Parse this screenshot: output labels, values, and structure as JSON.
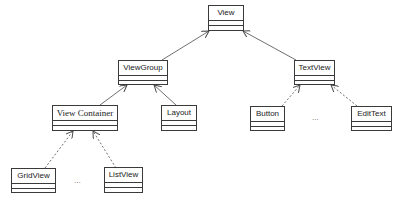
{
  "diagram": {
    "type": "uml-class-hierarchy",
    "classes": [
      {
        "id": "view",
        "name": "View"
      },
      {
        "id": "viewgroup",
        "name": "ViewGroup"
      },
      {
        "id": "textview",
        "name": "TextView"
      },
      {
        "id": "viewcontainer",
        "name": "View Container"
      },
      {
        "id": "layout",
        "name": "Layout"
      },
      {
        "id": "button",
        "name": "Button"
      },
      {
        "id": "edittext",
        "name": "EditText"
      },
      {
        "id": "gridview",
        "name": "GridView"
      },
      {
        "id": "listview",
        "name": "ListView"
      }
    ],
    "ellipses": [
      {
        "id": "textview-more",
        "text": "..."
      },
      {
        "id": "viewcontainer-more",
        "text": "..."
      }
    ],
    "relations": [
      {
        "from": "viewgroup",
        "to": "view",
        "style": "solid",
        "arrow": "open"
      },
      {
        "from": "textview",
        "to": "view",
        "style": "solid",
        "arrow": "open"
      },
      {
        "from": "viewcontainer",
        "to": "viewgroup",
        "style": "solid",
        "arrow": "open"
      },
      {
        "from": "layout",
        "to": "viewgroup",
        "style": "solid",
        "arrow": "open"
      },
      {
        "from": "button",
        "to": "textview",
        "style": "dashed",
        "arrow": "open"
      },
      {
        "from": "edittext",
        "to": "textview",
        "style": "dashed",
        "arrow": "open"
      },
      {
        "from": "gridview",
        "to": "viewcontainer",
        "style": "dashed",
        "arrow": "open"
      },
      {
        "from": "listview",
        "to": "viewcontainer",
        "style": "dashed",
        "arrow": "open"
      }
    ],
    "colors": {
      "line": "#4a4a4a",
      "box_border": "#3a3a3a",
      "text": "#222222",
      "background": "#ffffff"
    }
  }
}
